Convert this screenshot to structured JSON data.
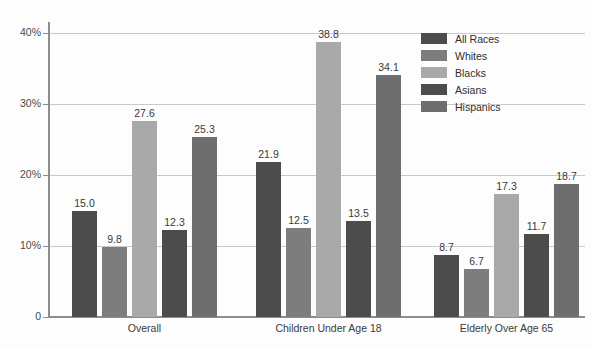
{
  "chart_data": {
    "type": "bar",
    "title": "",
    "subtitle": "",
    "xlabel": "",
    "ylabel": "",
    "categories": [
      "Overall",
      "Children Under Age 18",
      "Elderly Over Age 65"
    ],
    "series": [
      {
        "name": "All Races",
        "color": "#4c4c4c",
        "values": [
          15.0,
          21.9,
          8.7
        ]
      },
      {
        "name": "Whites",
        "color": "#7d7d7d",
        "values": [
          9.8,
          12.5,
          6.7
        ]
      },
      {
        "name": "Blacks",
        "color": "#a9a9a9",
        "values": [
          27.6,
          38.8,
          17.3
        ]
      },
      {
        "name": "Asians",
        "color": "#4c4c4c",
        "values": [
          12.3,
          13.5,
          11.7
        ]
      },
      {
        "name": "Hispanics",
        "color": "#6e6e6e",
        "values": [
          25.3,
          34.1,
          18.7
        ]
      }
    ],
    "value_labels": [
      [
        "15.0",
        "9.8",
        "27.6",
        "12.3",
        "25.3"
      ],
      [
        "21.9",
        "12.5",
        "38.8",
        "13.5",
        "34.1"
      ],
      [
        "8.7",
        "6.7",
        "17.3",
        "11.7",
        "18.7"
      ]
    ],
    "ylim": [
      0,
      43
    ],
    "yticks": [
      0,
      10,
      20,
      30,
      40
    ],
    "ytick_labels": [
      "0",
      "10%",
      "20%",
      "30%",
      "40%"
    ],
    "grid": true,
    "grid_axis": "y",
    "legend_position": "top-right",
    "legend": [
      "All Races",
      "Whites",
      "Blacks",
      "Asians",
      "Hispanics"
    ]
  },
  "axis": {
    "y": {
      "labels": [
        "40%",
        "30%",
        "20%",
        "10%",
        "0"
      ]
    }
  }
}
